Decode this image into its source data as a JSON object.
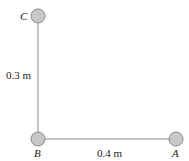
{
  "diagram": {
    "masses": [
      {
        "id": "C",
        "label": "C"
      },
      {
        "id": "B",
        "label": "B"
      },
      {
        "id": "A",
        "label": "A"
      }
    ],
    "rods": [
      {
        "from": "B",
        "to": "C",
        "length_label": "0.3 m"
      },
      {
        "from": "B",
        "to": "A",
        "length_label": "0.4 m"
      }
    ],
    "colors": {
      "mass_fill": "#c8c8c8",
      "mass_stroke": "#8a8a8a",
      "rod": "#8a8a8a"
    }
  }
}
